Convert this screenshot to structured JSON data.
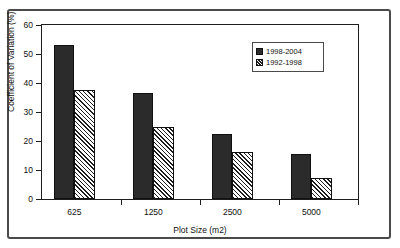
{
  "chart_data": {
    "type": "bar",
    "title": "",
    "xlabel": "Plot Size (m2)",
    "ylabel": "Coefficient of Variation (%)",
    "categories": [
      "625",
      "1250",
      "2500",
      "5000"
    ],
    "series": [
      {
        "name": "1998-2004",
        "values": [
          53,
          36.5,
          22.3,
          15.5
        ],
        "style": "solid",
        "color": "#2b2b2b"
      },
      {
        "name": "1992-1998",
        "values": [
          37.5,
          24.8,
          16.3,
          7.3
        ],
        "style": "hatch",
        "color": "#f2f2f2"
      }
    ],
    "ylim": [
      0,
      60
    ],
    "yticks": [
      0,
      10,
      20,
      30,
      40,
      50,
      60
    ],
    "ytick_labels": [
      "0",
      "10",
      "20",
      "30",
      "40",
      "50",
      "60"
    ],
    "grid": false,
    "legend_position": "top-right",
    "legend_entries": [
      "1998-2004",
      "1992-1998"
    ]
  }
}
